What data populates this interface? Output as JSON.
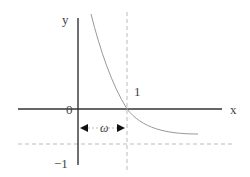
{
  "diagram": {
    "axes": {
      "x_label": "x",
      "y_label": "y",
      "origin_label": "0"
    },
    "tick_labels": {
      "x_one": "1",
      "y_minus_one": "−1"
    },
    "interval_label": "ω",
    "curve": {
      "description": "decreasing curve crossing x-axis at x=1, approaching y=-1 asymptotically",
      "x_intercept": 1,
      "asymptote_y": -1
    },
    "guides": {
      "vertical_dashed_at_x": 1,
      "horizontal_dashed_at_y": -1
    },
    "colors": {
      "axis": "#333333",
      "curve": "#999999",
      "dashed": "#bbbbbb",
      "text": "#444444",
      "arrow": "#111111"
    }
  }
}
